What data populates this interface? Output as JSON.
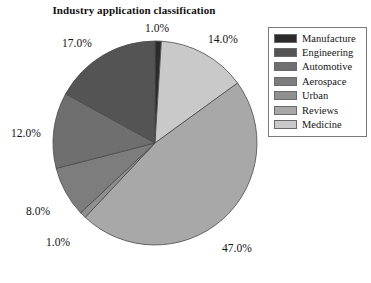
{
  "chart_data": {
    "type": "pie",
    "title": "Industry application classification",
    "categories": [
      "Manufacture",
      "Engineering",
      "Automotive",
      "Aerospace",
      "Urban",
      "Reviews",
      "Medicine"
    ],
    "values": [
      17,
      12,
      8,
      1,
      47,
      14,
      1
    ],
    "labels": [
      "17.0%",
      "12.0%",
      "8.0%",
      "1.0%",
      "47.0%",
      "14.0%",
      "1.0%"
    ],
    "colors": [
      "#2b2b2b",
      "#545454",
      "#6f6f6f",
      "#7d7d7d",
      "#8f8f8f",
      "#a8a8a8",
      "#c9c9c9"
    ],
    "legend_position": "right",
    "start_angle_deg": 90,
    "direction": "clockwise",
    "grid": false,
    "xlabel": "",
    "ylabel": ""
  },
  "pie": {
    "wedges": [
      {
        "name": "Manufacture",
        "percent_label": "1.0%",
        "value": 1,
        "color": "#2b2b2b"
      },
      {
        "name": "Medicine",
        "percent_label": "14.0%",
        "value": 14,
        "color": "#c9c9c9"
      },
      {
        "name": "Reviews",
        "percent_label": "47.0%",
        "value": 47,
        "color": "#a8a8a8"
      },
      {
        "name": "Urban",
        "percent_label": "1.0%",
        "value": 1,
        "color": "#8f8f8f"
      },
      {
        "name": "Aerospace",
        "percent_label": "8.0%",
        "value": 8,
        "color": "#7d7d7d"
      },
      {
        "name": "Automotive",
        "percent_label": "12.0%",
        "value": 12,
        "color": "#6f6f6f"
      },
      {
        "name": "Engineering",
        "percent_label": "17.0%",
        "value": 17,
        "color": "#545454"
      }
    ],
    "labels": {
      "top": "1.0%",
      "upper_right": "14.0%",
      "lower_right": "47.0%",
      "bottom_left": "1.0%",
      "left_lower": "8.0%",
      "left_mid": "12.0%",
      "upper_left": "17.0%"
    }
  },
  "legend": {
    "items": [
      {
        "label": "Manufacture",
        "color": "#2b2b2b"
      },
      {
        "label": "Engineering",
        "color": "#545454"
      },
      {
        "label": "Automotive",
        "color": "#6f6f6f"
      },
      {
        "label": "Aerospace",
        "color": "#7d7d7d"
      },
      {
        "label": "Urban",
        "color": "#8f8f8f"
      },
      {
        "label": "Reviews",
        "color": "#a8a8a8"
      },
      {
        "label": "Medicine",
        "color": "#c9c9c9"
      }
    ]
  }
}
